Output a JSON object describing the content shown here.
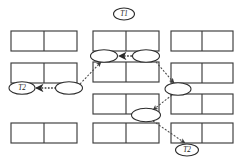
{
  "diagram": {
    "background_color": "#ffffff",
    "line_color": "#3b3b3b",
    "edge_color": "#4a4a4a",
    "text_color": "#1a1a1a",
    "width": 240,
    "height": 165
  },
  "transaction_labels": [
    {
      "id": "t1-top",
      "text": "T1",
      "cx": 124,
      "cy": 14,
      "rx": 10.5,
      "ry": 6.0
    },
    {
      "id": "t2-left",
      "text": "T2",
      "cx": 22,
      "cy": 88,
      "rx": 13.0,
      "ry": 6.3
    },
    {
      "id": "t2-bottom-right",
      "text": "T2",
      "cx": 187,
      "cy": 150,
      "rx": 11.5,
      "ry": 6.0
    }
  ],
  "columns": [
    {
      "name": "left-column",
      "x": 11,
      "width": 66,
      "tables": [
        {
          "id": "left-table-1",
          "y": 31,
          "height": 20
        },
        {
          "id": "left-table-2",
          "y": 63,
          "height": 20
        },
        {
          "id": "left-table-3",
          "y": 123,
          "height": 20
        }
      ]
    },
    {
      "name": "middle-column",
      "x": 93,
      "width": 66,
      "tables": [
        {
          "id": "middle-table-1",
          "y": 31,
          "height": 20
        },
        {
          "id": "middle-table-2",
          "y": 62,
          "height": 20
        },
        {
          "id": "middle-table-3",
          "y": 94,
          "height": 20
        },
        {
          "id": "middle-table-4",
          "y": 123,
          "height": 20
        }
      ]
    },
    {
      "name": "right-column",
      "x": 171,
      "width": 62,
      "tables": [
        {
          "id": "right-table-1",
          "y": 31,
          "height": 20
        },
        {
          "id": "right-table-2",
          "y": 63,
          "height": 20
        },
        {
          "id": "right-table-3",
          "y": 94,
          "height": 20
        },
        {
          "id": "right-table-4",
          "y": 123,
          "height": 20
        }
      ]
    }
  ],
  "lock_nodes": [
    {
      "id": "node-left-col",
      "cx": 69,
      "cy": 88,
      "rx": 13.5,
      "ry": 6.3
    },
    {
      "id": "node-mid-upper-left",
      "cx": 104,
      "cy": 56,
      "rx": 13.5,
      "ry": 6.3
    },
    {
      "id": "node-mid-upper-right",
      "cx": 146,
      "cy": 56,
      "rx": 13.5,
      "ry": 6.3
    },
    {
      "id": "node-right-col",
      "cx": 178,
      "cy": 89,
      "rx": 13.0,
      "ry": 6.3
    },
    {
      "id": "node-mid-lower",
      "cx": 146,
      "cy": 115,
      "rx": 14.5,
      "ry": 6.8
    }
  ],
  "edges": [
    {
      "id": "edge-mid-right-to-mid-left",
      "from": "node-mid-upper-right",
      "to": "node-mid-upper-left",
      "style": "dotted-thick",
      "x1": 132,
      "y1": 56,
      "x2": 119,
      "y2": 56
    },
    {
      "id": "edge-node-left-to-t2-left",
      "from": "node-left-col",
      "to": "t2-left",
      "style": "dotted-thick",
      "x1": 56,
      "y1": 88,
      "x2": 36,
      "y2": 88
    },
    {
      "id": "edge-left-to-mid-upper",
      "from": "node-left-col",
      "to": "node-mid-upper-left",
      "style": "dashed",
      "x1": 80,
      "y1": 84,
      "x2": 101,
      "y2": 62
    },
    {
      "id": "edge-mid-upper-to-right",
      "from": "node-mid-upper-right",
      "to": "node-right-col",
      "style": "dashed",
      "x1": 156,
      "y1": 62,
      "x2": 174,
      "y2": 83
    },
    {
      "id": "edge-right-to-mid-lower",
      "from": "node-right-col",
      "to": "node-mid-lower",
      "style": "dashed",
      "x1": 172,
      "y1": 95,
      "x2": 153,
      "y2": 110
    },
    {
      "id": "edge-mid-lower-to-t2-bottom",
      "from": "node-mid-lower",
      "to": "t2-bottom-right",
      "style": "dashed",
      "x1": 153,
      "y1": 121,
      "x2": 185,
      "y2": 143
    }
  ]
}
